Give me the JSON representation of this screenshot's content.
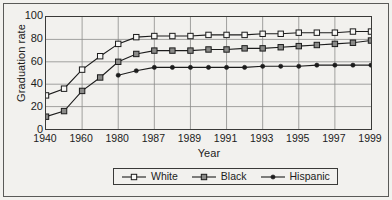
{
  "chart_data": {
    "type": "line",
    "title": "",
    "xlabel": "Year",
    "ylabel": "Graduation rate",
    "ylim": [
      0,
      100
    ],
    "yticks": [
      0,
      20,
      40,
      60,
      80,
      100
    ],
    "xticks": [
      "1940",
      "1960",
      "1980",
      "1987",
      "1989",
      "1991",
      "1993",
      "1995",
      "1997",
      "1999"
    ],
    "x_axis_note": "Categorical-style axis: 1940-1980 in 20-year steps, then every 2 years from 1987 to 1999; minor points plotted between labeled ticks",
    "grid": true,
    "legend_position": "bottom-center",
    "categories": [
      "1940",
      "1950",
      "1960",
      "1970",
      "1980",
      "1985",
      "1987",
      "1988",
      "1989",
      "1990",
      "1991",
      "1992",
      "1993",
      "1994",
      "1995",
      "1996",
      "1997",
      "1998",
      "1999"
    ],
    "series": [
      {
        "name": "White",
        "marker": "open-square",
        "color": "#1c1c1c",
        "values": [
          30,
          36,
          53,
          65,
          76,
          82,
          83,
          83,
          83,
          84,
          84,
          84,
          85,
          85,
          86,
          86,
          86,
          87,
          87
        ]
      },
      {
        "name": "Black",
        "marker": "filled-gray-square",
        "color": "#1c1c1c",
        "values": [
          11,
          16,
          34,
          46,
          60,
          67,
          70,
          70,
          70,
          71,
          71,
          72,
          72,
          73,
          74,
          75,
          76,
          77,
          79
        ]
      },
      {
        "name": "Hispanic",
        "marker": "filled-dot",
        "color": "#1c1c1c",
        "values": [
          null,
          null,
          null,
          null,
          48,
          52,
          55,
          55,
          55,
          55,
          55,
          55,
          56,
          56,
          56,
          57,
          57,
          57,
          57
        ]
      }
    ]
  },
  "legend": {
    "items": [
      {
        "label": "White",
        "marker": "open-square"
      },
      {
        "label": "Black",
        "marker": "filled-gray-square"
      },
      {
        "label": "Hispanic",
        "marker": "filled-dot"
      }
    ]
  }
}
